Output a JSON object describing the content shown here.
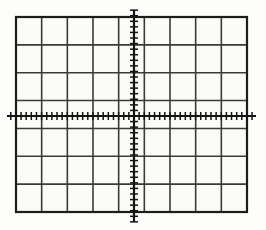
{
  "figure": {
    "kind": "cartesian-coordinate-grid",
    "title": ""
  },
  "chart_data": {
    "type": "scatter",
    "title": "",
    "subtitle": "",
    "xlabel": "",
    "ylabel": "",
    "x": [],
    "values": [],
    "series": [],
    "categories": [],
    "tick_labels": {
      "x": [],
      "y": []
    },
    "annotations": [],
    "legend": {
      "entries": [],
      "position": "none",
      "visible": false
    },
    "grid": {
      "visible": true,
      "columns": 9,
      "rows": 7,
      "cell_width_px": 25.7,
      "cell_height_px": 27.9,
      "minor_ticks_per_cell": 4
    },
    "axes": {
      "x_axis_row_from_top": 4,
      "y_axis_column_from_left": 4.6,
      "xlim": [
        -4.6,
        4.4
      ],
      "ylim": [
        -3,
        4
      ],
      "x_axis_visible": true,
      "y_axis_visible": true,
      "origin": {
        "x": 0,
        "y": 0
      }
    }
  },
  "geometry": {
    "canvas": {
      "width": 266,
      "height": 230
    },
    "plot_box": {
      "left": 16,
      "top": 17,
      "right": 247,
      "bottom": 212
    },
    "x_axis_y": 116,
    "y_axis_x": 134,
    "x_axis_extent": {
      "start": 7,
      "end": 256
    },
    "y_axis_extent": {
      "start": 10,
      "end": 222
    },
    "tick_half_length": 4
  },
  "colors": {
    "background": "#fdfdfb",
    "cell_fill": "#fbfbf8",
    "grid_line": "#3a3a3a",
    "grid_border": "#1c1c1c",
    "axis_line": "#141414",
    "tick_mark": "#141414"
  }
}
